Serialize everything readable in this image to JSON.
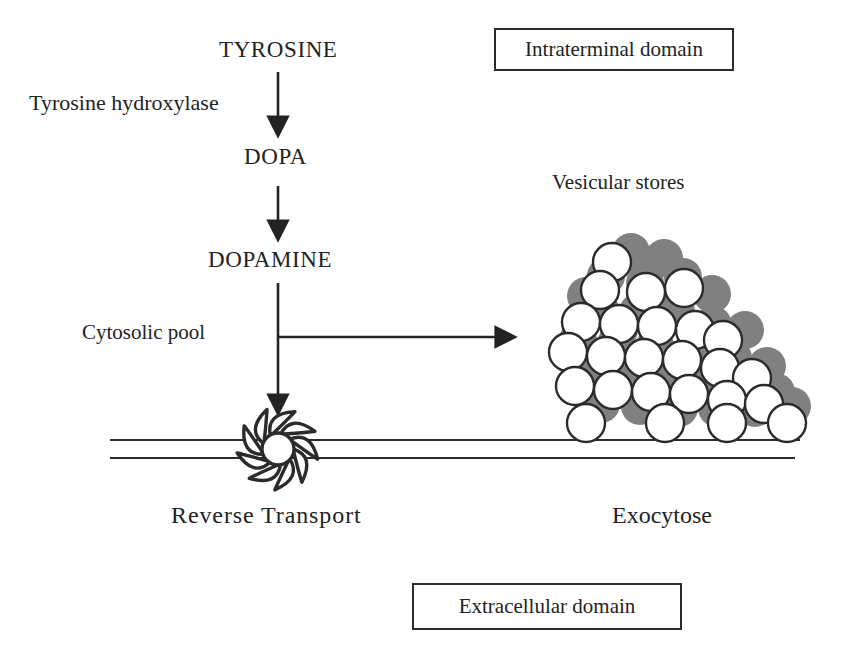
{
  "diagram": {
    "title_molecules": {
      "tyrosine": "TYROSINE",
      "dopa": "DOPA",
      "dopamine": "DOPAMINE"
    },
    "enzyme_label": "Tyrosine hydroxylase",
    "cytosolic_pool_label": "Cytosolic pool",
    "vesicular_stores_label": "Vesicular stores",
    "reverse_transport_label": "Reverse Transport",
    "exocytose_label": "Exocytose",
    "boxes": {
      "intraterminal": "Intraterminal domain",
      "extracellular": "Extracellular domain"
    },
    "colors": {
      "ink": "#232323",
      "line": "#2b2b2b",
      "vesicle_shadow": "#808080",
      "vesicle_fill": "#ffffff",
      "background": "#ffffff"
    },
    "vesicles_gray": [
      [
        631,
        252
      ],
      [
        664,
        258
      ],
      [
        606,
        276
      ],
      [
        645,
        283
      ],
      [
        683,
        277
      ],
      [
        712,
        294
      ],
      [
        600,
        310
      ],
      [
        638,
        312
      ],
      [
        676,
        312
      ],
      [
        713,
        325
      ],
      [
        745,
        330
      ],
      [
        578,
        340
      ],
      [
        616,
        344
      ],
      [
        655,
        346
      ],
      [
        694,
        348
      ],
      [
        733,
        358
      ],
      [
        767,
        366
      ],
      [
        586,
        374
      ],
      [
        624,
        378
      ],
      [
        662,
        380
      ],
      [
        700,
        382
      ],
      [
        739,
        390
      ],
      [
        776,
        392
      ],
      [
        601,
        404
      ],
      [
        640,
        406
      ],
      [
        679,
        408
      ],
      [
        717,
        408
      ],
      [
        755,
        408
      ],
      [
        792,
        406
      ],
      [
        619,
        330
      ],
      [
        586,
        296
      ]
    ],
    "vesicles_white": [
      [
        612,
        262
      ],
      [
        646,
        292
      ],
      [
        684,
        288
      ],
      [
        600,
        290
      ],
      [
        581,
        322
      ],
      [
        619,
        324
      ],
      [
        657,
        326
      ],
      [
        695,
        330
      ],
      [
        723,
        340
      ],
      [
        568,
        352
      ],
      [
        606,
        356
      ],
      [
        644,
        358
      ],
      [
        682,
        360
      ],
      [
        720,
        368
      ],
      [
        752,
        378
      ],
      [
        575,
        386
      ],
      [
        613,
        390
      ],
      [
        651,
        392
      ],
      [
        689,
        394
      ],
      [
        727,
        400
      ],
      [
        764,
        404
      ],
      [
        586,
        423
      ],
      [
        665,
        423
      ],
      [
        727,
        423
      ],
      [
        787,
        423
      ]
    ]
  }
}
